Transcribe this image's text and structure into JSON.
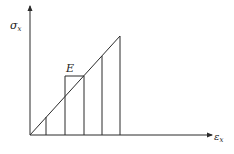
{
  "diagram": {
    "y_axis_label": {
      "symbol": "σ",
      "subscript": "x"
    },
    "x_axis_label": {
      "symbol": "ε",
      "subscript": "x"
    },
    "box_label": "E"
  },
  "colors": {
    "ink": "#2a2a2a",
    "background": "#ffffff"
  }
}
